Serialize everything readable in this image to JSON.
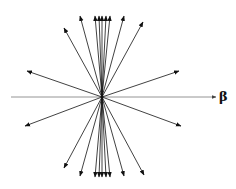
{
  "diagram": {
    "title": "",
    "axis_label": "β",
    "center": [
      102,
      97
    ],
    "axis": {
      "from": [
        11,
        97
      ],
      "to": [
        216,
        97
      ],
      "color": "#888888"
    },
    "arrow_color": "#111111",
    "arrows": [
      [
        95,
        16
      ],
      [
        99,
        16
      ],
      [
        102,
        16
      ],
      [
        106,
        16
      ],
      [
        110,
        16
      ],
      [
        80,
        16
      ],
      [
        124,
        16
      ],
      [
        64,
        28
      ],
      [
        143,
        22
      ],
      [
        27,
        71
      ],
      [
        25,
        126
      ],
      [
        179,
        71
      ],
      [
        181,
        126
      ],
      [
        64,
        168
      ],
      [
        80,
        176
      ],
      [
        124,
        176
      ],
      [
        144,
        175
      ],
      [
        95,
        177
      ],
      [
        99,
        177
      ],
      [
        102,
        177
      ],
      [
        106,
        177
      ],
      [
        110,
        177
      ]
    ]
  }
}
